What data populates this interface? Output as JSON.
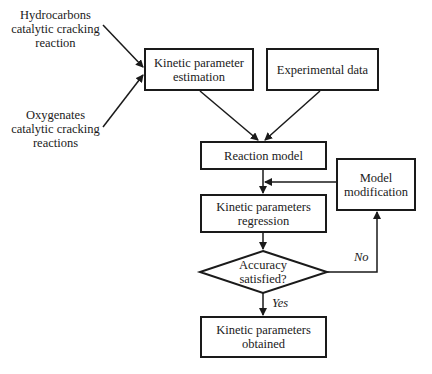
{
  "diagram": {
    "type": "flowchart",
    "inputs": {
      "hydrocarbons": "Hydrocarbons catalytic cracking reaction",
      "oxygenates": "Oxygenates catalytic cracking reactions"
    },
    "nodes": {
      "kinetic_parameter_estimation": "Kinetic parameter estimation",
      "experimental_data": "Experimental data",
      "reaction_model": "Reaction model",
      "model_modification": "Model modification",
      "kinetic_parameters_regression": "Kinetic parameters regression",
      "accuracy_decision": "Accuracy satisfied?",
      "kinetic_parameters_obtained": "Kinetic parameters obtained"
    },
    "edge_labels": {
      "no": "No",
      "yes": "Yes"
    },
    "edges": [
      {
        "from": "hydrocarbons",
        "to": "kinetic_parameter_estimation"
      },
      {
        "from": "oxygenates",
        "to": "kinetic_parameter_estimation"
      },
      {
        "from": "kinetic_parameter_estimation",
        "to": "reaction_model"
      },
      {
        "from": "experimental_data",
        "to": "reaction_model"
      },
      {
        "from": "reaction_model",
        "to": "kinetic_parameters_regression"
      },
      {
        "from": "model_modification",
        "to": "kinetic_parameters_regression"
      },
      {
        "from": "kinetic_parameters_regression",
        "to": "accuracy_decision"
      },
      {
        "from": "accuracy_decision",
        "to": "model_modification",
        "label": "No"
      },
      {
        "from": "accuracy_decision",
        "to": "kinetic_parameters_obtained",
        "label": "Yes"
      }
    ],
    "colors": {
      "stroke": "#1a1a1a",
      "background": "#ffffff"
    }
  }
}
